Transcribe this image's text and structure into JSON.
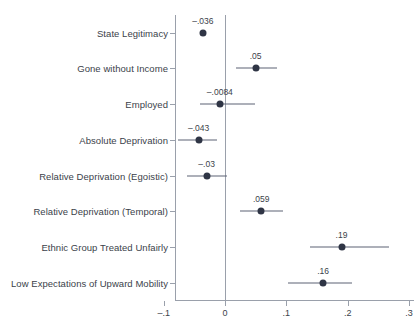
{
  "chart_data": {
    "type": "scatter",
    "title": "",
    "subtitle": "",
    "xlabel": "",
    "ylabel": "",
    "orientation": "horizontal",
    "plot_style": "coefficient-plot-with-confidence-intervals",
    "grid": false,
    "legend": "none",
    "zero_reference_line": 0,
    "xlim": [
      -0.1,
      0.3
    ],
    "xticks": [
      -0.1,
      0,
      0.1,
      0.2,
      0.3
    ],
    "xtick_labels": [
      "–.1",
      "0",
      ".1",
      ".2",
      ".3"
    ],
    "categories": [
      "State Legitimacy",
      "Gone without Income",
      "Employed",
      "Absolute Deprivation",
      "Relative Deprivation (Egoistic)",
      "Relative Deprivation (Temporal)",
      "Ethnic Group Treated Unfairly",
      "Low Expectations of Upward Mobility"
    ],
    "values": [
      -0.036,
      0.05,
      -0.0084,
      -0.043,
      -0.03,
      0.059,
      0.19,
      0.16
    ],
    "value_labels": [
      "–.036",
      ".05",
      "–.0084",
      "–.043",
      "–.03",
      ".059",
      ".19",
      ".16"
    ],
    "ci_low": [
      -0.038,
      0.018,
      -0.041,
      -0.076,
      -0.062,
      0.024,
      0.138,
      0.102
    ],
    "ci_high": [
      -0.034,
      0.085,
      0.049,
      -0.013,
      0.003,
      0.095,
      0.268,
      0.207
    ],
    "colors": {
      "marker": "#2f3545",
      "ci": "#5d6374",
      "axis": "#9aa0ab",
      "text": "#3b3f4a",
      "background": "#ffffff"
    }
  },
  "layout": {
    "plot_left_px": 175,
    "plot_right_px": 414,
    "plot_top_px": 15,
    "plot_bottom_px": 300,
    "x_zero_px": 225,
    "px_per_unit": 613.3,
    "row_y_px": [
      33,
      68,
      104,
      140,
      176,
      211,
      247,
      283
    ]
  }
}
